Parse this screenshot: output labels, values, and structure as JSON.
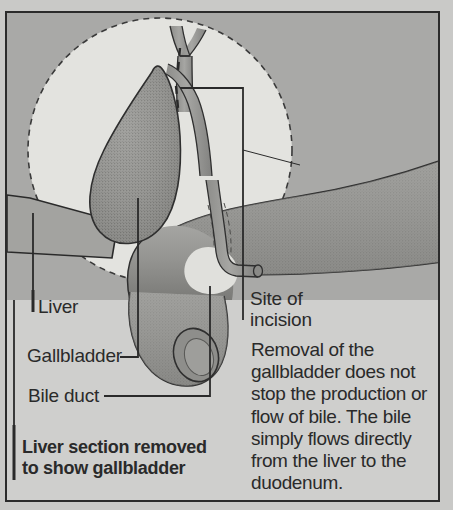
{
  "figure": {
    "frame_border_color": "#2b2b2b",
    "background_color": "#c9c9c7",
    "illustration_background_color": "#a9a9a7",
    "cutaway_circle_color": "#e2e2de",
    "organ_fill_color": "#9a9a97",
    "ink_color": "#2a2a2a"
  },
  "labels": {
    "liver": "Liver",
    "gallbladder": "Gallbladder",
    "bile_duct": "Bile duct",
    "site_of_incision": "Site of\nincision"
  },
  "caption": {
    "bold_note": "Liver section removed\nto show gallbladder"
  },
  "body": {
    "paragraph": "Removal of the\ngallbladder does not\nstop the production or\nflow of bile. The bile\nsimply flows directly\nfrom the liver to the\nduodenum."
  },
  "anatomy_parts": [
    "hepatic-duct",
    "gallbladder",
    "cystic-duct",
    "common-bile-duct",
    "duodenum",
    "liver-section-plane",
    "incision-dashed-line",
    "cutaway-circle"
  ]
}
